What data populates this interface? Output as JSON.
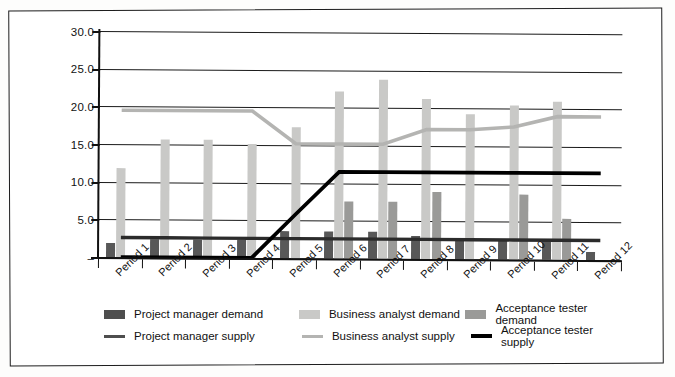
{
  "chart_data": {
    "type": "bar",
    "title": "",
    "subtitle": "",
    "xlabel": "",
    "ylabel": "",
    "grid": true,
    "legend_position": "bottom",
    "ylim": [
      0,
      30
    ],
    "ytick_values": [
      0,
      5,
      10,
      15,
      20,
      25,
      30
    ],
    "ytick_labels": [
      "–",
      "5.0",
      "10.0",
      "15.0",
      "20.0",
      "25.0",
      "30.0"
    ],
    "categories": [
      "Period 1",
      "Period 2",
      "Period 3",
      "Period 4",
      "Period 5",
      "Period 6",
      "Period 7",
      "Period 8",
      "Period 9",
      "Period 10",
      "Period 11",
      "Period 12"
    ],
    "bar_series": [
      {
        "name": "Project manager demand",
        "color": "#585858",
        "values": [
          1.8,
          2.4,
          2.4,
          2.4,
          3.6,
          3.6,
          3.6,
          3.0,
          2.6,
          2.6,
          2.6,
          1.0
        ]
      },
      {
        "name": "Business analyst demand",
        "color": "#c9c9c7",
        "values": [
          11.8,
          15.6,
          15.6,
          15.2,
          17.4,
          22.2,
          23.7,
          21.2,
          19.2,
          20.4,
          21.0,
          0
        ]
      },
      {
        "name": "Acceptance tester demand",
        "color": "#9a9a98",
        "values": [
          0,
          0,
          0,
          0,
          0,
          7.6,
          7.6,
          8.9,
          0,
          8.6,
          5.4,
          0
        ]
      }
    ],
    "line_series": [
      {
        "name": "Project manager supply",
        "color": "#2b2b2b",
        "values": [
          2.6,
          2.6,
          2.6,
          2.6,
          2.6,
          2.6,
          2.6,
          2.6,
          2.6,
          2.6,
          2.6,
          2.6
        ]
      },
      {
        "name": "Business analyst supply",
        "color": "#b4b4b2",
        "values": [
          19.5,
          19.5,
          19.5,
          19.5,
          15.2,
          15.2,
          15.2,
          17.2,
          17.2,
          17.6,
          19.0,
          19.0
        ]
      },
      {
        "name": "Acceptance tester supply",
        "color": "#000000",
        "values": [
          0.0,
          0.0,
          0.0,
          0.0,
          5.8,
          11.5,
          11.5,
          11.5,
          11.5,
          11.5,
          11.5,
          11.5
        ]
      }
    ]
  },
  "legend": {
    "items": [
      {
        "label": "Project manager demand",
        "marker": "box",
        "color": "#4e4e4e"
      },
      {
        "label": "Business analyst demand",
        "marker": "box",
        "color": "#c9c9c7"
      },
      {
        "label": "Acceptance tester demand",
        "marker": "box",
        "color": "#9a9a98"
      },
      {
        "label": "Project manager supply",
        "marker": "line",
        "color": "#4e4e4e"
      },
      {
        "label": "Business analyst supply",
        "marker": "line",
        "color": "#b4b4b2"
      },
      {
        "label": "Acceptance tester supply",
        "marker": "line",
        "color": "#000000"
      }
    ]
  }
}
